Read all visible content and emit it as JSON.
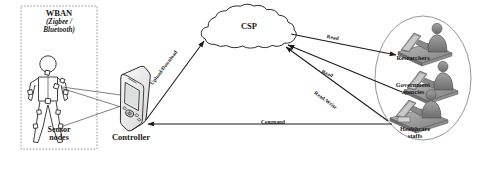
{
  "diagram": {
    "background_color": "#ffffff",
    "line_color": "#1a1a1a"
  },
  "wban": {
    "title": "WBAN",
    "subtitle": "(Zigbee /\nBluetooth)",
    "subtitle_line1": "(Zigbee /",
    "subtitle_line2": "Bluetooth)",
    "sensor_label_line1": "Sensor",
    "sensor_label_line2": "nodes",
    "border_style": "dotted"
  },
  "controller": {
    "label": "Controller",
    "device_type": "pda-handheld"
  },
  "cloud": {
    "label": "CSP"
  },
  "users": {
    "researchers_line1": "Researchers",
    "government_line1": "Government",
    "government_line2": "agencies",
    "healthcare_line1": "Healthcare",
    "healthcare_line2": "staffs"
  },
  "links": {
    "upload_download": "Upload/Download",
    "read_top": "Read",
    "read_middle": "Read",
    "read_write": "Read/Write",
    "command": "Command"
  }
}
